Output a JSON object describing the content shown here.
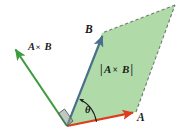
{
  "figure": {
    "background_color": "#ffffff",
    "width": 192,
    "height": 138
  },
  "colors": {
    "vector_a": "#df3c1e",
    "vector_b": "#4a6f8a",
    "vector_cross": "#3f9b3f",
    "parallelogram_fill": "#a9d8a2",
    "parallelogram_dashed_edge": "#6e7a70",
    "label_text": "#1b1b1b",
    "right_angle_marker": "#7a8a80"
  },
  "labels": {
    "vector_a": "A",
    "vector_b": "B",
    "cross_product": "A × B",
    "cross_magnitude": "|A × B|",
    "angle": "θ"
  },
  "label_parts": {
    "cross_left": "A",
    "cross_times": "×",
    "cross_right": "B",
    "magnitude_bar_open": "|",
    "magnitude_left": "A",
    "magnitude_times": "×",
    "magnitude_right": "B",
    "magnitude_bar_close": "|"
  },
  "geometry": {
    "origin": {
      "x": 67,
      "y": 126
    },
    "vector_a_tip": {
      "x": 136,
      "y": 112
    },
    "vector_b_tip": {
      "x": 102,
      "y": 33
    },
    "vector_cross_tip": {
      "x": 13,
      "y": 47
    },
    "parallelogram_far_corner": {
      "x": 175,
      "y": 5
    },
    "angle_theta_degrees": 62
  },
  "label_positions": {
    "vector_a": {
      "x": 137,
      "y": 121
    },
    "vector_b": {
      "x": 87,
      "y": 33
    },
    "cross_product": {
      "x": 28,
      "y": 50
    },
    "cross_magnitude": {
      "x": 100,
      "y": 73
    },
    "angle": {
      "x": 85,
      "y": 113
    }
  },
  "elements": [
    {
      "name": "parallelogram-area",
      "type": "polygon",
      "interactable": false
    },
    {
      "name": "vector-a-arrow",
      "type": "arrow",
      "interactable": false
    },
    {
      "name": "vector-b-arrow",
      "type": "arrow",
      "interactable": false
    },
    {
      "name": "vector-cross-arrow",
      "type": "arrow",
      "interactable": false
    },
    {
      "name": "angle-theta-arc",
      "type": "arc",
      "interactable": false
    },
    {
      "name": "right-angle-marker",
      "type": "marker",
      "interactable": false
    }
  ]
}
